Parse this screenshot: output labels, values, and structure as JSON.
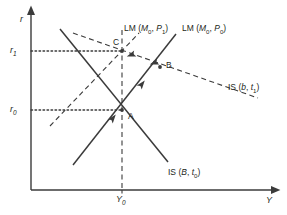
{
  "figure": {
    "type": "is-lm-diagram",
    "background": "#ffffff",
    "line_color": "#3b3b3b",
    "axes": {
      "y_axis_label": "r",
      "x_axis_label": "Y",
      "y_ticks": [
        {
          "id": "r1",
          "label": "r",
          "sub": "1",
          "y_px": 51
        },
        {
          "id": "r0",
          "label": "r",
          "sub": "0",
          "y_px": 110
        }
      ],
      "x_ticks": [
        {
          "id": "Y0",
          "label": "Y",
          "sub": "0",
          "x_px": 122
        }
      ],
      "origin_px": {
        "x": 31,
        "y": 190
      },
      "x_axis_end_px": 272,
      "y_axis_top_px": 14
    },
    "points": [
      {
        "name": "A",
        "x_px": 122,
        "y_px": 110,
        "label_dx": 6,
        "label_dy": 2
      },
      {
        "name": "B",
        "x_px": 160,
        "y_px": 67,
        "label_dx": 6,
        "label_dy": -6
      },
      {
        "name": "C",
        "x_px": 122,
        "y_px": 51,
        "label_dx": -9,
        "label_dy": -13
      }
    ],
    "curves": [
      {
        "id": "lm-m0-p0",
        "label_prefix": "LM (",
        "label_var1": "M",
        "label_sub1": "0",
        "label_sep": ", ",
        "label_var2": "P",
        "label_sub2": "0",
        "label_suffix": ")",
        "style": "solid",
        "x1": 73,
        "y1": 165,
        "x2": 176,
        "y2": 34,
        "label_x": 182,
        "label_y": 24
      },
      {
        "id": "lm-m0-p1",
        "label_prefix": "LM (",
        "label_var1": "M",
        "label_sub1": "0",
        "label_sep": ", ",
        "label_var2": "P",
        "label_sub2": "1",
        "label_suffix": ")",
        "style": "dashed",
        "x1": 50,
        "y1": 126,
        "x2": 139,
        "y2": 33,
        "label_x": 124,
        "label_y": 24
      },
      {
        "id": "is-B-t0",
        "label_prefix": "IS (",
        "label_var1": "B",
        "label_sub1": "",
        "label_sep": ", ",
        "label_var2": "t",
        "label_sub2": "0",
        "label_suffix": ")",
        "style": "solid",
        "x1": 60,
        "y1": 29,
        "x2": 168,
        "y2": 162,
        "label_x": 168,
        "label_y": 168
      },
      {
        "id": "is-b-t1",
        "label_prefix": "IS (",
        "label_var1": "b",
        "label_sub1": "",
        "label_sep": ", ",
        "label_var2": "t",
        "label_sub2": "1",
        "label_suffix": ")",
        "style": "dashed",
        "x1": 73,
        "y1": 33,
        "x2": 258,
        "y2": 98,
        "label_x": 228,
        "label_y": 83
      }
    ],
    "guides": [
      {
        "id": "guide-r1",
        "style": "dotted",
        "x1": 31,
        "y1": 51,
        "x2": 122,
        "y2": 51
      },
      {
        "id": "guide-r0",
        "style": "dotted",
        "x1": 31,
        "y1": 110,
        "x2": 122,
        "y2": 110
      },
      {
        "id": "guide-Y0",
        "style": "dashed",
        "x1": 122,
        "y1": 30,
        "x2": 122,
        "y2": 190
      }
    ],
    "arrows": [
      {
        "id": "arrow-A-to-B-lower",
        "x": 113,
        "y": 118,
        "angle": -52
      },
      {
        "id": "arrow-A-to-B-upper",
        "x": 142,
        "y": 84,
        "angle": -52
      },
      {
        "id": "arrow-B-to-C-right",
        "x": 154,
        "y": 63,
        "angle": 160
      },
      {
        "id": "arrow-B-to-C-left",
        "x": 131,
        "y": 55,
        "angle": 160
      }
    ]
  }
}
